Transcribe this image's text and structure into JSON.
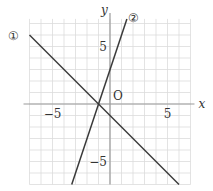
{
  "chart_data": {
    "type": "line",
    "title": "",
    "xlabel": "x",
    "ylabel": "y",
    "origin_label": "O",
    "xlim": [
      -7,
      7
    ],
    "ylim": [
      -7,
      7.4
    ],
    "xticks": [
      {
        "value": -5,
        "label": "−5"
      },
      {
        "value": 5,
        "label": "5"
      }
    ],
    "yticks": [
      {
        "value": 5,
        "label": "5"
      },
      {
        "value": -5,
        "label": "−5"
      }
    ],
    "grid": true,
    "series": [
      {
        "name": "①",
        "equation": "y = -x - 1",
        "slope": -1,
        "intercept": -1,
        "points": [
          [
            -7,
            6
          ],
          [
            6,
            -7
          ]
        ]
      },
      {
        "name": "②",
        "equation": "y = 3x + 3",
        "slope": 3,
        "intercept": 3,
        "points": [
          [
            -3.33,
            -7
          ],
          [
            1.47,
            7.4
          ]
        ]
      }
    ],
    "intersection": [
      -1,
      0
    ]
  },
  "colors": {
    "grid": "#dcdcdc",
    "axis": "#9a9a9a",
    "line": "#3a3a3a",
    "text": "#333333"
  }
}
